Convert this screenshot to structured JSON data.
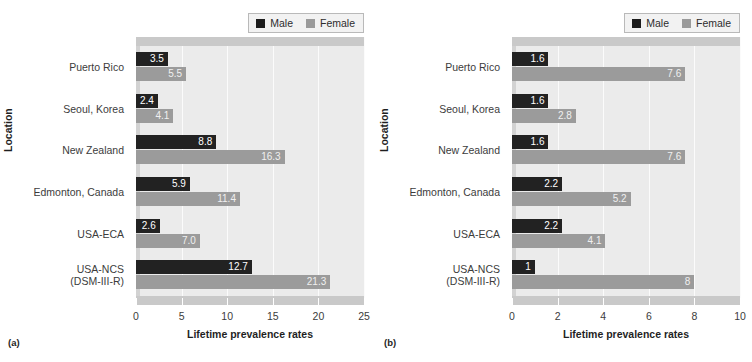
{
  "legend": {
    "entries": [
      {
        "label": "Male",
        "color": "#1c1c1c"
      },
      {
        "label": "Female",
        "color": "#9a9a9a"
      }
    ]
  },
  "panels": {
    "a": {
      "tag": "(a)",
      "ylabel": "Location",
      "xlabel": "Lifetime prevalence rates"
    },
    "b": {
      "tag": "(b)",
      "ylabel": "Location",
      "xlabel": "Lifetime prevalence rates"
    }
  },
  "chart_data": [
    {
      "type": "bar",
      "title": "",
      "panel": "(a)",
      "orientation": "horizontal",
      "xlabel": "Lifetime prevalence rates",
      "ylabel": "Location",
      "xlim": [
        0,
        25
      ],
      "xticks": [
        0,
        5,
        10,
        15,
        20,
        25
      ],
      "xtick_labels": [
        "0",
        "5",
        "10",
        "15",
        "20",
        "25"
      ],
      "grid": true,
      "legend_position": "top-right",
      "categories": [
        "Puerto Rico",
        "Seoul, Korea",
        "New Zealand",
        "Edmonton, Canada",
        "USA-ECA",
        "USA-NCS (DSM-III-R)"
      ],
      "category_lines": [
        [
          "Puerto Rico"
        ],
        [
          "Seoul, Korea"
        ],
        [
          "New Zealand"
        ],
        [
          "Edmonton, Canada"
        ],
        [
          "USA-ECA"
        ],
        [
          "USA-NCS",
          "(DSM-III-R)"
        ]
      ],
      "series": [
        {
          "name": "Male",
          "color": "#222222",
          "values": [
            3.5,
            2.4,
            8.8,
            5.9,
            2.6,
            12.7
          ],
          "labels": [
            "3.5",
            "2.4",
            "8.8",
            "5.9",
            "2.6",
            "12.7"
          ]
        },
        {
          "name": "Female",
          "color": "#9b9b9b",
          "values": [
            5.5,
            4.1,
            16.3,
            11.4,
            7.0,
            21.3
          ],
          "labels": [
            "5.5",
            "4.1",
            "16.3",
            "11.4",
            "7.0",
            "21.3"
          ]
        }
      ]
    },
    {
      "type": "bar",
      "title": "",
      "panel": "(b)",
      "orientation": "horizontal",
      "xlabel": "Lifetime prevalence rates",
      "ylabel": "Location",
      "xlim": [
        0,
        10
      ],
      "xticks": [
        0,
        2,
        4,
        6,
        8,
        10
      ],
      "xtick_labels": [
        "0",
        "2",
        "4",
        "6",
        "8",
        "10"
      ],
      "grid": true,
      "legend_position": "top-right",
      "categories": [
        "Puerto Rico",
        "Seoul, Korea",
        "New Zealand",
        "Edmonton, Canada",
        "USA-ECA",
        "USA-NCS (DSM-III-R)"
      ],
      "category_lines": [
        [
          "Puerto Rico"
        ],
        [
          "Seoul, Korea"
        ],
        [
          "New Zealand"
        ],
        [
          "Edmonton, Canada"
        ],
        [
          "USA-ECA"
        ],
        [
          "USA-NCS",
          "(DSM-III-R)"
        ]
      ],
      "series": [
        {
          "name": "Male",
          "color": "#222222",
          "values": [
            1.6,
            1.6,
            1.6,
            2.2,
            2.2,
            1.0
          ],
          "labels": [
            "1.6",
            "1.6",
            "1.6",
            "2.2",
            "2.2",
            "1"
          ]
        },
        {
          "name": "Female",
          "color": "#9b9b9b",
          "values": [
            7.6,
            2.8,
            7.6,
            5.2,
            4.1,
            8.0
          ],
          "labels": [
            "7.6",
            "2.8",
            "7.6",
            "5.2",
            "4.1",
            "8"
          ]
        }
      ]
    }
  ]
}
